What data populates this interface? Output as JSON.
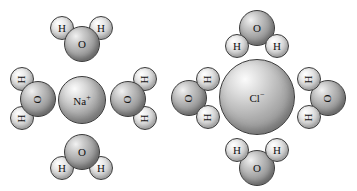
{
  "figure": {
    "background_color": "#ffffff",
    "atom_colors": {
      "oxygen": "#9a9a9a",
      "hydrogen": "#d8d8d8",
      "outline": "#3a3a3a",
      "label": "#111111"
    }
  },
  "units": [
    {
      "id": "sodium-unit",
      "ion": {
        "name": "sodium-ion",
        "symbol": "Na",
        "charge": "+",
        "label": "Na+",
        "cx": 82,
        "cy": 100,
        "r": 24
      },
      "waters": [
        {
          "name": "water-top",
          "position": "top",
          "orientation": "oxygen-toward-ion",
          "oxygen": {
            "label": "O",
            "cx": 82,
            "cy": 44,
            "r": 18,
            "rotated": false
          },
          "hydrogens": [
            {
              "label": "H",
              "cx": 62,
              "cy": 28,
              "r": 12,
              "rotated": false
            },
            {
              "label": "H",
              "cx": 101,
              "cy": 28,
              "r": 12,
              "rotated": false
            }
          ]
        },
        {
          "name": "water-left",
          "position": "left",
          "orientation": "oxygen-toward-ion",
          "oxygen": {
            "label": "O",
            "cx": 38,
            "cy": 99,
            "r": 18,
            "rotated": true
          },
          "hydrogens": [
            {
              "label": "H",
              "cx": 22,
              "cy": 79,
              "r": 12,
              "rotated": true
            },
            {
              "label": "H",
              "cx": 22,
              "cy": 118,
              "r": 12,
              "rotated": true
            }
          ]
        },
        {
          "name": "water-right",
          "position": "right",
          "orientation": "oxygen-toward-ion",
          "oxygen": {
            "label": "O",
            "cx": 128,
            "cy": 99,
            "r": 18,
            "rotated": true
          },
          "hydrogens": [
            {
              "label": "H",
              "cx": 145,
              "cy": 79,
              "r": 12,
              "rotated": true
            },
            {
              "label": "H",
              "cx": 145,
              "cy": 118,
              "r": 12,
              "rotated": true
            }
          ]
        },
        {
          "name": "water-bottom",
          "position": "bottom",
          "orientation": "oxygen-toward-ion",
          "oxygen": {
            "label": "O",
            "cx": 82,
            "cy": 152,
            "r": 18,
            "rotated": false
          },
          "hydrogens": [
            {
              "label": "H",
              "cx": 62,
              "cy": 168,
              "r": 12,
              "rotated": false
            },
            {
              "label": "H",
              "cx": 101,
              "cy": 168,
              "r": 12,
              "rotated": false
            }
          ]
        }
      ]
    },
    {
      "id": "chloride-unit",
      "ion": {
        "name": "chloride-ion",
        "symbol": "Cl",
        "charge": "-",
        "label": "Cl-",
        "cx": 257,
        "cy": 97,
        "r": 38
      },
      "waters": [
        {
          "name": "water-top",
          "position": "top",
          "orientation": "hydrogens-toward-ion",
          "oxygen": {
            "label": "O",
            "cx": 257,
            "cy": 28,
            "r": 18,
            "rotated": false
          },
          "hydrogens": [
            {
              "label": "H",
              "cx": 237,
              "cy": 46,
              "r": 12,
              "rotated": false
            },
            {
              "label": "H",
              "cx": 277,
              "cy": 46,
              "r": 12,
              "rotated": false
            }
          ]
        },
        {
          "name": "water-left",
          "position": "left",
          "orientation": "hydrogens-toward-ion",
          "oxygen": {
            "label": "O",
            "cx": 189,
            "cy": 98,
            "r": 18,
            "rotated": true
          },
          "hydrogens": [
            {
              "label": "H",
              "cx": 208,
              "cy": 79,
              "r": 12,
              "rotated": true
            },
            {
              "label": "H",
              "cx": 208,
              "cy": 117,
              "r": 12,
              "rotated": true
            }
          ]
        },
        {
          "name": "water-right",
          "position": "right",
          "orientation": "hydrogens-toward-ion",
          "oxygen": {
            "label": "O",
            "cx": 328,
            "cy": 98,
            "r": 18,
            "rotated": true
          },
          "hydrogens": [
            {
              "label": "H",
              "cx": 309,
              "cy": 79,
              "r": 12,
              "rotated": true
            },
            {
              "label": "H",
              "cx": 309,
              "cy": 117,
              "r": 12,
              "rotated": true
            }
          ]
        },
        {
          "name": "water-bottom",
          "position": "bottom",
          "orientation": "hydrogens-toward-ion",
          "oxygen": {
            "label": "O",
            "cx": 257,
            "cy": 168,
            "r": 18,
            "rotated": false
          },
          "hydrogens": [
            {
              "label": "H",
              "cx": 237,
              "cy": 150,
              "r": 12,
              "rotated": false
            },
            {
              "label": "H",
              "cx": 277,
              "cy": 150,
              "r": 12,
              "rotated": false
            }
          ]
        }
      ]
    }
  ]
}
